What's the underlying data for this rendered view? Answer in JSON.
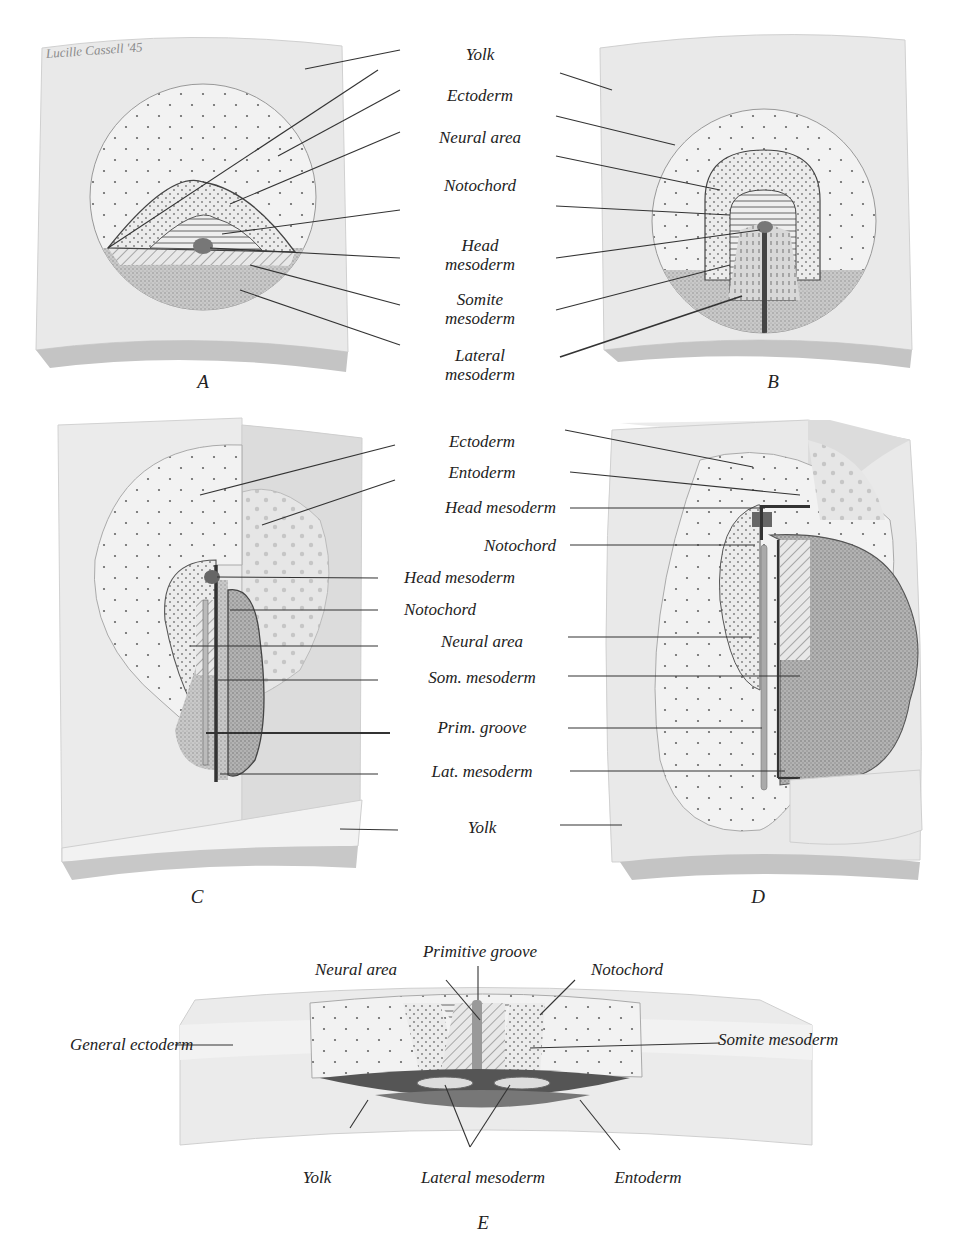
{
  "figure": {
    "signature": "Lucille Cassell '45",
    "colors": {
      "background": "#ffffff",
      "yolk_block": "#e9e9e9",
      "yolk_edge": "#c4c4c4",
      "ectoderm": "#f1f1f1",
      "lateral_mesoderm": "#bdbdbd",
      "ink": "#333333"
    },
    "panels": {
      "A": {
        "letter": "A"
      },
      "B": {
        "letter": "B"
      },
      "C": {
        "letter": "C"
      },
      "D": {
        "letter": "D"
      },
      "E": {
        "letter": "E"
      }
    },
    "labels_AB": [
      {
        "text": "Yolk"
      },
      {
        "text": "Ectoderm"
      },
      {
        "text": "Neural area"
      },
      {
        "text": "Notochord"
      },
      {
        "line1": "Head",
        "line2": "mesoderm"
      },
      {
        "line1": "Somite",
        "line2": "mesoderm"
      },
      {
        "line1": "Lateral",
        "line2": "mesoderm"
      }
    ],
    "labels_CD": [
      {
        "text": "Ectoderm"
      },
      {
        "text": "Entoderm"
      },
      {
        "text": "Head mesoderm"
      },
      {
        "text": "Notochord"
      },
      {
        "text": "Head mesoderm"
      },
      {
        "text": "Notochord"
      },
      {
        "text": "Neural area"
      },
      {
        "text": "Som. mesoderm"
      },
      {
        "text": "Prim. groove"
      },
      {
        "text": "Lat. mesoderm"
      },
      {
        "text": "Yolk"
      }
    ],
    "labels_E": {
      "primitive_groove": "Primitive groove",
      "neural_area": "Neural area",
      "notochord": "Notochord",
      "general_ectoderm": "General ectoderm",
      "somite_mesoderm": "Somite mesoderm",
      "yolk": "Yolk",
      "lateral_mesoderm": "Lateral mesoderm",
      "entoderm": "Entoderm"
    }
  }
}
